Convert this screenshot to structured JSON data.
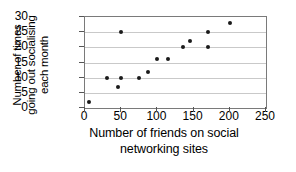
{
  "chart_data": {
    "type": "scatter",
    "title": "",
    "xlabel": "Number of friends on social networking sites",
    "ylabel": "Number of times going out socialising each month",
    "xlabel_lines": [
      "Number of friends on social",
      "networking sites"
    ],
    "ylabel_lines": [
      "Number of times",
      "going out socialising",
      "each month"
    ],
    "xlim": [
      0,
      250
    ],
    "ylim": [
      0,
      30
    ],
    "xticks": [
      0,
      50,
      100,
      150,
      200,
      250
    ],
    "yticks": [
      0,
      5,
      10,
      15,
      20,
      25,
      30
    ],
    "xtick_labels": [
      "0",
      "50",
      "100",
      "150",
      "200",
      "250"
    ],
    "ytick_labels": [
      "0",
      "5",
      "10",
      "15",
      "20",
      "25",
      "30"
    ],
    "grid": "horizontal",
    "legend": "none",
    "marker_color": "#1a1a1a",
    "gridline_color": "#c9c9c9",
    "frame_color": "#7a7a7a",
    "points": [
      {
        "x": 5,
        "y": 2
      },
      {
        "x": 30,
        "y": 10
      },
      {
        "x": 45,
        "y": 7
      },
      {
        "x": 50,
        "y": 10
      },
      {
        "x": 50,
        "y": 25
      },
      {
        "x": 75,
        "y": 10
      },
      {
        "x": 87,
        "y": 12
      },
      {
        "x": 100,
        "y": 16
      },
      {
        "x": 115,
        "y": 16
      },
      {
        "x": 135,
        "y": 20
      },
      {
        "x": 145,
        "y": 22
      },
      {
        "x": 170,
        "y": 20
      },
      {
        "x": 170,
        "y": 25
      },
      {
        "x": 200,
        "y": 28
      }
    ]
  }
}
